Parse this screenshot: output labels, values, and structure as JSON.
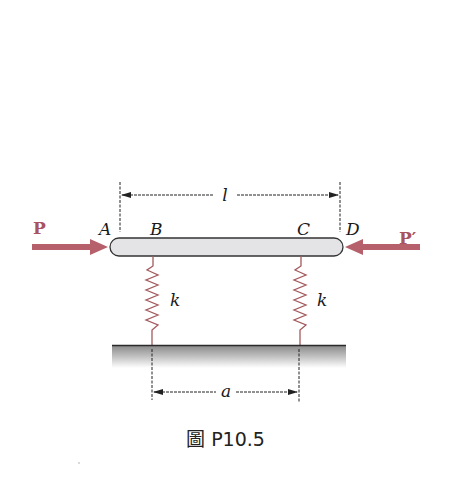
{
  "figure": {
    "caption": "圖 P10.5",
    "caption_prefix": "圖",
    "caption_number": "P10.5"
  },
  "labels": {
    "force_left": "P",
    "force_right": "P′",
    "point_a": "A",
    "point_b": "B",
    "point_c": "C",
    "point_d": "D",
    "spring_left": "k",
    "spring_right": "k",
    "length_dim": "l",
    "spacing_dim": "a"
  },
  "colors": {
    "force_arrow": "#b5606a",
    "spring": "#a35a5e",
    "bar_fill": "#e4e4e6",
    "bar_stroke": "#333333",
    "ground_line": "#2a2a2a",
    "dimension_lines": "#222222"
  }
}
